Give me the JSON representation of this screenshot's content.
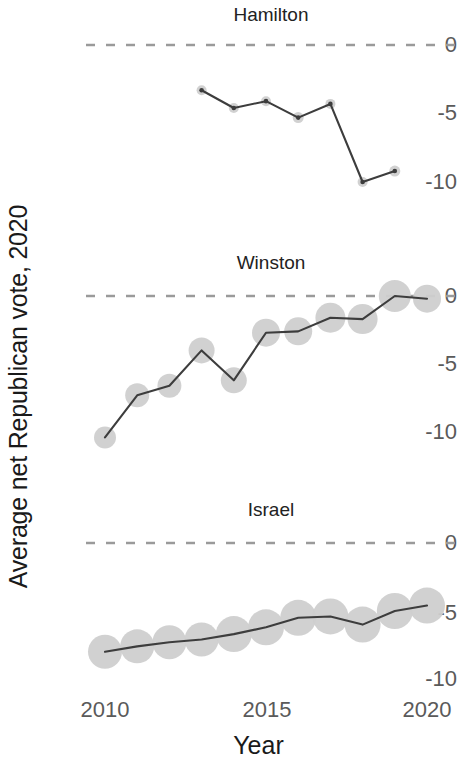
{
  "axes": {
    "y_title": "Average net Republican vote, 2020",
    "x_title": "Year",
    "y_ticks": [
      "0",
      "-5",
      "-10"
    ],
    "x_ticks": [
      "2010",
      "2015",
      "2020"
    ]
  },
  "panels": [
    {
      "title": "Hamilton"
    },
    {
      "title": "Winston"
    },
    {
      "title": "Israel"
    }
  ],
  "style": {
    "line_color": "#3d3d3d",
    "point_fill": "#cfcfcf",
    "zero_line_color": "#9a9a9a",
    "tick_color": "#5a5a5a",
    "background": "#ffffff"
  },
  "chart_data": {
    "type": "line",
    "title": "",
    "xlabel": "Year",
    "ylabel": "Average net Republican vote, 2020",
    "xlim": [
      2009.5,
      2020.5
    ],
    "ylim": [
      -11.5,
      1.5
    ],
    "x_ticks": [
      2010,
      2015,
      2020
    ],
    "y_ticks": [
      0,
      -5,
      -10
    ],
    "grid": false,
    "legend": "none",
    "facet_layout": "3 rows x 1 column, shared x and y axes",
    "annotations": [
      {
        "type": "reference_line",
        "y": 0,
        "style": "dashed",
        "color": "#9a9a9a"
      }
    ],
    "note": "Point marker size encodes an unlabeled weight variable (larger circle = larger weight).",
    "panels": [
      {
        "name": "Hamilton",
        "x": [
          2013,
          2014,
          2015,
          2016,
          2017,
          2018,
          2019
        ],
        "y": [
          -3.3,
          -4.6,
          -4.1,
          -5.3,
          -4.3,
          -10.0,
          -9.2
        ],
        "point_sizes": [
          5,
          5,
          5,
          5.5,
          5,
          5,
          5.5
        ]
      },
      {
        "name": "Winston",
        "x": [
          2010,
          2011,
          2012,
          2013,
          2014,
          2015,
          2016,
          2017,
          2018,
          2019,
          2020
        ],
        "y": [
          -10.4,
          -7.3,
          -6.6,
          -4.0,
          -6.2,
          -2.7,
          -2.6,
          -1.6,
          -1.7,
          0.0,
          -0.2
        ],
        "point_sizes": [
          11,
          12,
          12,
          13,
          13,
          14,
          14,
          15,
          15,
          16,
          14
        ]
      },
      {
        "name": "Israel",
        "x": [
          2010,
          2011,
          2012,
          2013,
          2014,
          2015,
          2016,
          2017,
          2018,
          2019,
          2020
        ],
        "y": [
          -8.0,
          -7.6,
          -7.3,
          -7.1,
          -6.7,
          -6.2,
          -5.5,
          -5.4,
          -6.0,
          -5.0,
          -4.6
        ],
        "point_sizes": [
          17,
          17,
          17,
          17,
          18,
          18,
          18,
          18,
          18,
          18,
          18
        ]
      }
    ]
  }
}
